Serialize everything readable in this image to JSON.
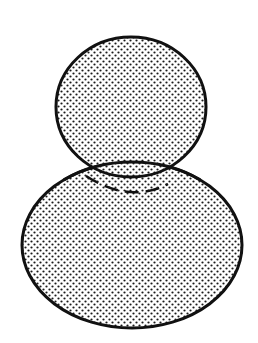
{
  "diagram": {
    "width": 258,
    "height": 343,
    "background": "#ffffff",
    "stroke_color": "#111111",
    "dot_color": "#1a1a1a",
    "pattern_spacing": 6,
    "shapes": {
      "top_circle": {
        "cx": 131,
        "cy": 107,
        "rx": 75,
        "ry": 70
      },
      "bottom_ellipse": {
        "cx": 132,
        "cy": 245,
        "rx": 110,
        "ry": 83
      },
      "hidden_arc": {
        "path": "M 86 176 Q 130 204 168 184",
        "dash": "14 7"
      }
    }
  }
}
